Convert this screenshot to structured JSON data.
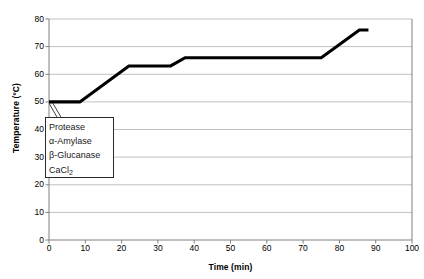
{
  "chart_data": {
    "type": "line",
    "title": "",
    "xlabel": "Time (min)",
    "ylabel": "Temperature (ºC)",
    "xlim": [
      0,
      100
    ],
    "ylim": [
      0,
      80
    ],
    "xticks": [
      0,
      10,
      20,
      30,
      40,
      50,
      60,
      70,
      80,
      90,
      100
    ],
    "yticks": [
      0,
      10,
      20,
      30,
      40,
      50,
      60,
      70,
      80
    ],
    "grid": "horizontal",
    "legend_position": "none",
    "series": [
      {
        "name": "Mashing temperature profile",
        "color": "#000000",
        "x": [
          0,
          8.5,
          22,
          33.5,
          37.5,
          75,
          85.5,
          88
        ],
        "y": [
          50,
          50,
          63,
          63,
          66,
          66,
          76,
          76
        ]
      }
    ],
    "annotations": [
      {
        "name": "enzyme-addition-callout",
        "lines": [
          "Protease",
          "α-Amylase",
          "β-Glucanase",
          "CaCl"
        ],
        "subscripts": [
          "",
          "",
          "",
          "2"
        ],
        "points_to_x": 1,
        "points_to_y": 50
      }
    ]
  },
  "axes": {
    "x_title": "Time (min)",
    "y_title": "Temperature (ºC)"
  },
  "callout": {
    "line1": "Protease",
    "line2": "α-Amylase",
    "line3": "β-Glucanase",
    "line4_main": "CaCl",
    "line4_sub": "2"
  }
}
